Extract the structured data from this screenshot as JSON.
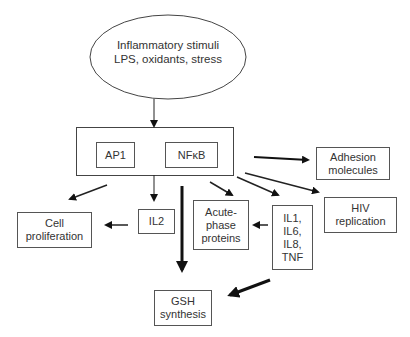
{
  "diagram": {
    "source": {
      "label": "Inflammatory stimuli\nLPS, oxidants, stress"
    },
    "transcription_factors": {
      "ap1": "AP1",
      "nfkb": "NFκB"
    },
    "outputs": {
      "cell_proliferation": "Cell\nproliferation",
      "il2": "IL2",
      "acute_phase": "Acute-\nphase\nproteins",
      "cytokines": "IL1,\nIL6,\nIL8,\nTNF",
      "adhesion": "Adhesion\nmolecules",
      "hiv": "HIV\nreplication",
      "gsh": "GSH\nsynthesis"
    },
    "edges": [
      {
        "from": "stimuli",
        "to": "transcription-factors"
      },
      {
        "from": "transcription-factors",
        "to": "cell-proliferation"
      },
      {
        "from": "transcription-factors",
        "to": "il2"
      },
      {
        "from": "il2",
        "to": "cell-proliferation"
      },
      {
        "from": "transcription-factors",
        "to": "gsh-synthesis",
        "weight": "bold"
      },
      {
        "from": "transcription-factors",
        "to": "acute-phase-proteins"
      },
      {
        "from": "transcription-factors",
        "to": "cytokines"
      },
      {
        "from": "transcription-factors",
        "to": "hiv-replication"
      },
      {
        "from": "transcription-factors",
        "to": "adhesion-molecules"
      },
      {
        "from": "cytokines",
        "to": "acute-phase-proteins"
      },
      {
        "from": "cytokines",
        "to": "gsh-synthesis",
        "weight": "bold"
      }
    ]
  }
}
